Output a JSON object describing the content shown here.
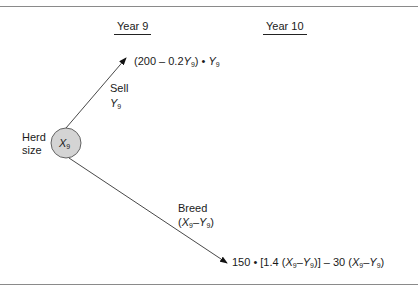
{
  "diagram": {
    "headers": {
      "year9": "Year 9",
      "year10": "Year 10"
    },
    "node": {
      "label_line1": "Herd",
      "label_line2": "size",
      "symbol": "X",
      "subscript": "9",
      "fill": "#d4d4d4"
    },
    "sell_branch": {
      "label": "Sell",
      "var": "Y",
      "var_sub": "9",
      "outcome": {
        "p1": "(200 – 0.2",
        "v1": "Y",
        "s1": "9",
        "p2": ") • ",
        "v2": "Y",
        "s2": "9"
      }
    },
    "breed_branch": {
      "label": "Breed",
      "expr": {
        "open": "(",
        "v1": "X",
        "s1": "9",
        "minus": "–",
        "v2": "Y",
        "s2": "9",
        "close": ")"
      },
      "outcome": {
        "p1": "150 • [1.4 (",
        "v1": "X",
        "s1": "9",
        "m1": "–",
        "v2": "Y",
        "s2": "9",
        "p2": ")] – 30 (",
        "v3": "X",
        "s3": "9",
        "m2": "–",
        "v4": "Y",
        "s4": "9",
        "p3": ")"
      }
    }
  }
}
